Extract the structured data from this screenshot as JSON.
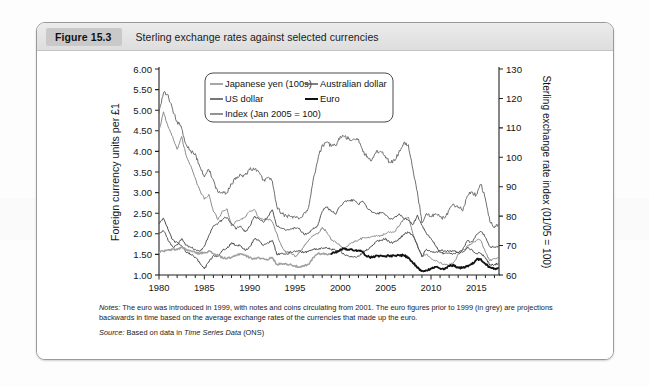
{
  "figure": {
    "badge": "Figure 15.3",
    "title": "Sterling exchange rates against selected currencies",
    "notes_label": "Notes:",
    "notes_text": " The euro was introduced in 1999, with notes and coins circulating from 2001. The euro figures prior to 1999 (in grey) are projections backwards in time based on the average exchange rates of the currencies that made up the euro.",
    "source_label": "Source:",
    "source_pre": " Based on data in ",
    "source_italic": "Time Series Data",
    "source_post": " (ONS)"
  },
  "colors": {
    "yen": "#8a8a8a",
    "usdollar": "#4a4a4a",
    "index": "#6f6f6f",
    "ausdollar": "#555555",
    "euro": "#121212",
    "euro_projection": "#a0a0a0",
    "axis": "#222222",
    "header_badge": "#c9c9c9"
  },
  "chart_data": {
    "type": "line",
    "title": "Sterling exchange rates against selected currencies",
    "xlabel": "",
    "ylabel": "Foreign currency units per £1",
    "y2label": "Sterling exchange rate index (01/05 = 100)",
    "xlim": [
      1980,
      2017.5
    ],
    "ylim": [
      1.0,
      6.0
    ],
    "y2lim": [
      60,
      130
    ],
    "grid": false,
    "legend_position": "top-center",
    "x_ticks": [
      1980,
      1985,
      1990,
      1995,
      2000,
      2005,
      2010,
      2015
    ],
    "x_tick_labels": [
      "1980",
      "1985",
      "1990",
      "1995",
      "2000",
      "2005",
      "2010",
      "2015"
    ],
    "x_minor_tick_interval": 1,
    "y_ticks": [
      1.0,
      1.5,
      2.0,
      2.5,
      3.0,
      3.5,
      4.0,
      4.5,
      5.0,
      5.5,
      6.0
    ],
    "y_tick_labels": [
      "1.00",
      "1.50",
      "2.00",
      "2.50",
      "3.00",
      "3.50",
      "4.00",
      "4.50",
      "5.00",
      "5.50",
      "6.00"
    ],
    "y2_ticks": [
      60,
      70,
      80,
      90,
      100,
      110,
      120,
      130
    ],
    "y2_tick_labels": [
      "60",
      "70",
      "80",
      "90",
      "100",
      "110",
      "120",
      "130"
    ],
    "series": [
      {
        "name": "Japanese yen (100s)",
        "axis": "left",
        "color": "#8a8a8a",
        "width": 1.0,
        "x": [
          1980.0,
          1980.5,
          1981.0,
          1981.5,
          1982.0,
          1982.5,
          1983.0,
          1983.5,
          1984.0,
          1984.5,
          1985.0,
          1985.5,
          1986.0,
          1986.5,
          1987.0,
          1987.5,
          1988.0,
          1988.5,
          1989.0,
          1989.5,
          1990.0,
          1990.5,
          1991.0,
          1991.5,
          1992.0,
          1992.5,
          1993.0,
          1993.5,
          1994.0,
          1994.5,
          1995.0,
          1995.5,
          1996.0,
          1996.5,
          1997.0,
          1997.5,
          1998.0,
          1998.5,
          1999.0,
          1999.5,
          2000.0,
          2000.5,
          2001.0,
          2001.5,
          2002.0,
          2002.5,
          2003.0,
          2003.5,
          2004.0,
          2004.5,
          2005.0,
          2005.5,
          2006.0,
          2006.5,
          2007.0,
          2007.5,
          2008.0,
          2008.5,
          2009.0,
          2009.5,
          2010.0,
          2010.5,
          2011.0,
          2011.5,
          2012.0,
          2012.5,
          2013.0,
          2013.5,
          2014.0,
          2014.5,
          2015.0,
          2015.5,
          2016.0,
          2016.5,
          2017.0,
          2017.4
        ],
        "y": [
          4.5,
          4.95,
          4.6,
          4.35,
          4.05,
          4.35,
          3.9,
          3.65,
          3.35,
          3.05,
          2.85,
          2.95,
          2.55,
          2.35,
          2.55,
          2.6,
          2.2,
          2.3,
          2.35,
          2.4,
          2.55,
          2.6,
          2.4,
          2.35,
          2.35,
          2.3,
          2.0,
          1.7,
          1.55,
          1.55,
          1.45,
          1.55,
          1.7,
          1.85,
          1.95,
          2.0,
          2.15,
          2.05,
          1.85,
          1.8,
          1.7,
          1.65,
          1.75,
          1.8,
          1.85,
          1.9,
          1.9,
          1.95,
          1.95,
          1.95,
          2.0,
          2.05,
          2.05,
          2.2,
          2.35,
          2.4,
          2.0,
          1.7,
          1.45,
          1.5,
          1.4,
          1.35,
          1.3,
          1.25,
          1.25,
          1.3,
          1.5,
          1.6,
          1.7,
          1.75,
          1.85,
          1.85,
          1.55,
          1.35,
          1.4,
          1.43
        ]
      },
      {
        "name": "US dollar",
        "axis": "left",
        "color": "#4a4a4a",
        "width": 1.0,
        "x": [
          1980.0,
          1980.5,
          1981.0,
          1981.5,
          1982.0,
          1982.5,
          1983.0,
          1983.5,
          1984.0,
          1984.5,
          1985.0,
          1985.5,
          1986.0,
          1986.5,
          1987.0,
          1987.5,
          1988.0,
          1988.5,
          1989.0,
          1989.5,
          1990.0,
          1990.5,
          1991.0,
          1991.5,
          1992.0,
          1992.5,
          1993.0,
          1993.5,
          1994.0,
          1994.5,
          1995.0,
          1995.5,
          1996.0,
          1996.5,
          1997.0,
          1997.5,
          1998.0,
          1998.5,
          1999.0,
          1999.5,
          2000.0,
          2000.5,
          2001.0,
          2001.5,
          2002.0,
          2002.5,
          2003.0,
          2003.5,
          2004.0,
          2004.5,
          2005.0,
          2005.5,
          2006.0,
          2006.5,
          2007.0,
          2007.5,
          2008.0,
          2008.5,
          2009.0,
          2009.5,
          2010.0,
          2010.5,
          2011.0,
          2011.5,
          2012.0,
          2012.5,
          2013.0,
          2013.5,
          2014.0,
          2014.5,
          2015.0,
          2015.5,
          2016.0,
          2016.5,
          2017.0,
          2017.4
        ],
        "y": [
          2.25,
          2.38,
          2.1,
          1.85,
          1.78,
          1.72,
          1.55,
          1.5,
          1.42,
          1.3,
          1.15,
          1.32,
          1.47,
          1.45,
          1.6,
          1.65,
          1.78,
          1.72,
          1.72,
          1.6,
          1.68,
          1.88,
          1.85,
          1.72,
          1.78,
          1.85,
          1.5,
          1.52,
          1.5,
          1.56,
          1.58,
          1.58,
          1.55,
          1.58,
          1.63,
          1.62,
          1.65,
          1.66,
          1.62,
          1.6,
          1.58,
          1.48,
          1.44,
          1.45,
          1.45,
          1.56,
          1.62,
          1.7,
          1.82,
          1.84,
          1.88,
          1.78,
          1.8,
          1.88,
          1.98,
          2.04,
          1.96,
          1.72,
          1.45,
          1.62,
          1.55,
          1.55,
          1.6,
          1.58,
          1.58,
          1.58,
          1.55,
          1.55,
          1.67,
          1.62,
          1.52,
          1.53,
          1.42,
          1.25,
          1.25,
          1.28
        ]
      },
      {
        "name": "Index (Jan 2005 = 100)",
        "axis": "right",
        "color": "#6f6f6f",
        "width": 1.0,
        "x": [
          1980.0,
          1980.5,
          1981.0,
          1981.5,
          1982.0,
          1982.5,
          1983.0,
          1983.5,
          1984.0,
          1984.5,
          1985.0,
          1985.5,
          1986.0,
          1986.5,
          1987.0,
          1987.5,
          1988.0,
          1988.5,
          1989.0,
          1989.5,
          1990.0,
          1990.5,
          1991.0,
          1991.5,
          1992.0,
          1992.5,
          1993.0,
          1993.5,
          1994.0,
          1994.5,
          1995.0,
          1995.5,
          1996.0,
          1996.5,
          1997.0,
          1997.5,
          1998.0,
          1998.5,
          1999.0,
          1999.5,
          2000.0,
          2000.5,
          2001.0,
          2001.5,
          2002.0,
          2002.5,
          2003.0,
          2003.5,
          2004.0,
          2004.5,
          2005.0,
          2005.5,
          2006.0,
          2006.5,
          2007.0,
          2007.5,
          2008.0,
          2008.5,
          2009.0,
          2009.5,
          2010.0,
          2010.5,
          2011.0,
          2011.5,
          2012.0,
          2012.5,
          2013.0,
          2013.5,
          2014.0,
          2014.5,
          2015.0,
          2015.5,
          2016.0,
          2016.5,
          2017.0,
          2017.4
        ],
        "y": [
          115,
          122,
          121,
          116,
          112,
          110,
          104,
          102,
          101,
          97,
          93,
          96,
          92,
          88,
          88,
          88,
          91,
          93,
          94,
          94,
          96,
          96,
          95,
          92,
          93,
          92,
          83,
          81,
          80,
          80,
          80,
          79,
          81,
          83,
          92,
          99,
          104,
          105,
          104,
          104,
          107,
          107,
          106,
          106,
          106,
          102,
          100,
          99,
          102,
          102,
          100,
          98,
          99,
          102,
          105,
          104,
          96,
          88,
          78,
          81,
          80,
          81,
          80,
          79,
          82,
          84,
          83,
          82,
          87,
          88,
          87,
          91,
          86,
          78,
          76,
          77
        ]
      },
      {
        "name": "Australian dollar",
        "axis": "left",
        "color": "#555555",
        "width": 1.0,
        "x": [
          1980.0,
          1980.5,
          1981.0,
          1981.5,
          1982.0,
          1982.5,
          1983.0,
          1983.5,
          1984.0,
          1984.5,
          1985.0,
          1985.5,
          1986.0,
          1986.5,
          1987.0,
          1987.5,
          1988.0,
          1988.5,
          1989.0,
          1989.5,
          1990.0,
          1990.5,
          1991.0,
          1991.5,
          1992.0,
          1992.5,
          1993.0,
          1993.5,
          1994.0,
          1994.5,
          1995.0,
          1995.5,
          1996.0,
          1996.5,
          1997.0,
          1997.5,
          1998.0,
          1998.5,
          1999.0,
          1999.5,
          2000.0,
          2000.5,
          2001.0,
          2001.5,
          2002.0,
          2002.5,
          2003.0,
          2003.5,
          2004.0,
          2004.5,
          2005.0,
          2005.5,
          2006.0,
          2006.5,
          2007.0,
          2007.5,
          2008.0,
          2008.5,
          2009.0,
          2009.5,
          2010.0,
          2010.5,
          2011.0,
          2011.5,
          2012.0,
          2012.5,
          2013.0,
          2013.5,
          2014.0,
          2014.5,
          2015.0,
          2015.5,
          2016.0,
          2016.5,
          2017.0,
          2017.4
        ],
        "y": [
          2.02,
          2.08,
          1.85,
          1.68,
          1.72,
          1.88,
          1.72,
          1.68,
          1.62,
          1.58,
          1.7,
          1.95,
          2.2,
          2.25,
          2.35,
          2.4,
          2.25,
          2.12,
          2.18,
          2.05,
          2.18,
          2.42,
          2.38,
          2.28,
          2.42,
          2.58,
          2.18,
          2.15,
          2.08,
          2.12,
          2.15,
          2.12,
          1.98,
          2.02,
          2.12,
          2.2,
          2.55,
          2.65,
          2.55,
          2.48,
          2.68,
          2.78,
          2.8,
          2.82,
          2.72,
          2.78,
          2.62,
          2.52,
          2.48,
          2.52,
          2.45,
          2.35,
          2.4,
          2.48,
          2.38,
          2.32,
          2.22,
          2.45,
          2.2,
          2.0,
          1.88,
          1.72,
          1.55,
          1.52,
          1.53,
          1.52,
          1.55,
          1.62,
          1.83,
          1.8,
          1.97,
          2.07,
          1.92,
          1.68,
          1.67,
          1.7
        ]
      },
      {
        "name": "Euro",
        "axis": "left",
        "color": "#121212",
        "width": 1.8,
        "note": "pre-1999 values are grey backward projections",
        "x": [
          1980.0,
          1980.5,
          1981.0,
          1981.5,
          1982.0,
          1982.5,
          1983.0,
          1983.5,
          1984.0,
          1984.5,
          1985.0,
          1985.5,
          1986.0,
          1986.5,
          1987.0,
          1987.5,
          1988.0,
          1988.5,
          1989.0,
          1989.5,
          1990.0,
          1990.5,
          1991.0,
          1991.5,
          1992.0,
          1992.5,
          1993.0,
          1993.5,
          1994.0,
          1994.5,
          1995.0,
          1995.5,
          1996.0,
          1996.5,
          1997.0,
          1997.5,
          1998.0,
          1998.5,
          1999.0,
          1999.5,
          2000.0,
          2000.5,
          2001.0,
          2001.5,
          2002.0,
          2002.5,
          2003.0,
          2003.5,
          2004.0,
          2004.5,
          2005.0,
          2005.5,
          2006.0,
          2006.5,
          2007.0,
          2007.5,
          2008.0,
          2008.5,
          2009.0,
          2009.5,
          2010.0,
          2010.5,
          2011.0,
          2011.5,
          2012.0,
          2012.5,
          2013.0,
          2013.5,
          2014.0,
          2014.5,
          2015.0,
          2015.5,
          2016.0,
          2016.5,
          2017.0,
          2017.4
        ],
        "y": [
          1.55,
          1.58,
          1.6,
          1.62,
          1.62,
          1.68,
          1.62,
          1.58,
          1.55,
          1.52,
          1.55,
          1.58,
          1.52,
          1.48,
          1.42,
          1.4,
          1.42,
          1.48,
          1.52,
          1.48,
          1.42,
          1.4,
          1.42,
          1.4,
          1.38,
          1.42,
          1.25,
          1.28,
          1.27,
          1.26,
          1.22,
          1.18,
          1.22,
          1.25,
          1.42,
          1.52,
          1.52,
          1.5,
          1.52,
          1.55,
          1.62,
          1.64,
          1.62,
          1.6,
          1.6,
          1.55,
          1.45,
          1.43,
          1.48,
          1.46,
          1.46,
          1.46,
          1.46,
          1.48,
          1.48,
          1.42,
          1.3,
          1.18,
          1.1,
          1.12,
          1.15,
          1.2,
          1.15,
          1.14,
          1.22,
          1.24,
          1.18,
          1.18,
          1.22,
          1.26,
          1.38,
          1.38,
          1.27,
          1.18,
          1.16,
          1.17
        ]
      }
    ],
    "legend_entries": [
      {
        "label": "Japanese yen (100s)",
        "color": "#8a8a8a",
        "width": 1.0
      },
      {
        "label": "Australian dollar",
        "color": "#555555",
        "width": 1.0
      },
      {
        "label": "US dollar",
        "color": "#4a4a4a",
        "width": 1.0
      },
      {
        "label": "Euro",
        "color": "#121212",
        "width": 1.8
      },
      {
        "label": "Index (Jan 2005 = 100)",
        "color": "#6f6f6f",
        "width": 1.0
      }
    ]
  }
}
